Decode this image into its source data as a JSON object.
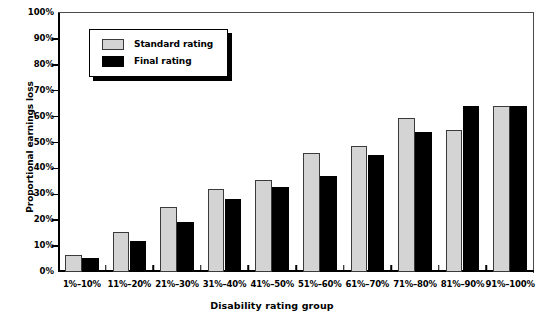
{
  "chart_data": {
    "type": "bar",
    "title": "",
    "xlabel": "Disability rating group",
    "ylabel": "Proportional earnings loss",
    "ylim": [
      0,
      100
    ],
    "ytick_labels": [
      "100%",
      "90%",
      "80%",
      "70%",
      "60%",
      "50%",
      "40%",
      "30%",
      "20%",
      "10%",
      "0%"
    ],
    "ytick_values": [
      100,
      90,
      80,
      70,
      60,
      50,
      40,
      30,
      20,
      10,
      0
    ],
    "grid": false,
    "legend_position": "upper left",
    "categories": [
      "1%–10%",
      "11%–20%",
      "21%–30%",
      "31%–40%",
      "41%–50%",
      "51%–60%",
      "61%–70%",
      "71%–80%",
      "81%–90%",
      "91%–100%"
    ],
    "series": [
      {
        "name": "Standard rating",
        "color": "#d4d4d4",
        "values": [
          6.5,
          15.5,
          25.0,
          32.0,
          35.5,
          46.0,
          48.5,
          59.5,
          55.0,
          64.0
        ]
      },
      {
        "name": "Final rating",
        "color": "#000000",
        "values": [
          5.5,
          12.0,
          19.5,
          28.0,
          33.0,
          37.0,
          45.0,
          54.0,
          64.0,
          64.0
        ]
      }
    ]
  }
}
